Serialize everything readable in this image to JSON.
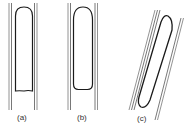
{
  "figure": {
    "panels": [
      {
        "id": "a",
        "label": "(a)",
        "description": "vertical tube, flat-bottomed bubble"
      },
      {
        "id": "b",
        "label": "(b)",
        "description": "vertical tube, rounded-bottom bubble"
      },
      {
        "id": "c",
        "label": "(c)",
        "description": "inclined tube, elongated bubble"
      }
    ],
    "colors": {
      "line": "#555555",
      "bubble": "#1a1a1a",
      "background": "#ffffff"
    }
  }
}
